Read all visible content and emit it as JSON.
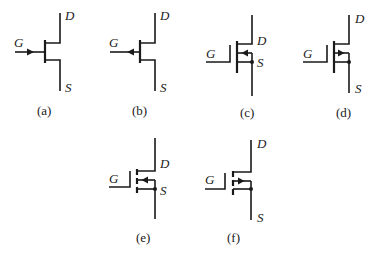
{
  "figure": {
    "symbols": [
      {
        "id": "a",
        "caption": "(a)",
        "type": "n-channel JFET",
        "terminals": {
          "gate": "G",
          "drain": "D",
          "source": "S"
        }
      },
      {
        "id": "b",
        "caption": "(b)",
        "type": "p-channel JFET",
        "terminals": {
          "gate": "G",
          "drain": "D",
          "source": "S"
        }
      },
      {
        "id": "c",
        "caption": "(c)",
        "type": "n-channel depletion MOSFET",
        "terminals": {
          "gate": "G",
          "drain": "D",
          "source": "S"
        }
      },
      {
        "id": "d",
        "caption": "(d)",
        "type": "p-channel depletion MOSFET",
        "terminals": {
          "gate": "G",
          "drain": "D",
          "source": "S"
        }
      },
      {
        "id": "e",
        "caption": "(e)",
        "type": "n-channel enhancement MOSFET",
        "terminals": {
          "gate": "G",
          "drain": "D",
          "source": "S"
        }
      },
      {
        "id": "f",
        "caption": "(f)",
        "type": "p-channel enhancement MOSFET",
        "terminals": {
          "gate": "G",
          "drain": "D",
          "source": "S"
        }
      }
    ]
  }
}
